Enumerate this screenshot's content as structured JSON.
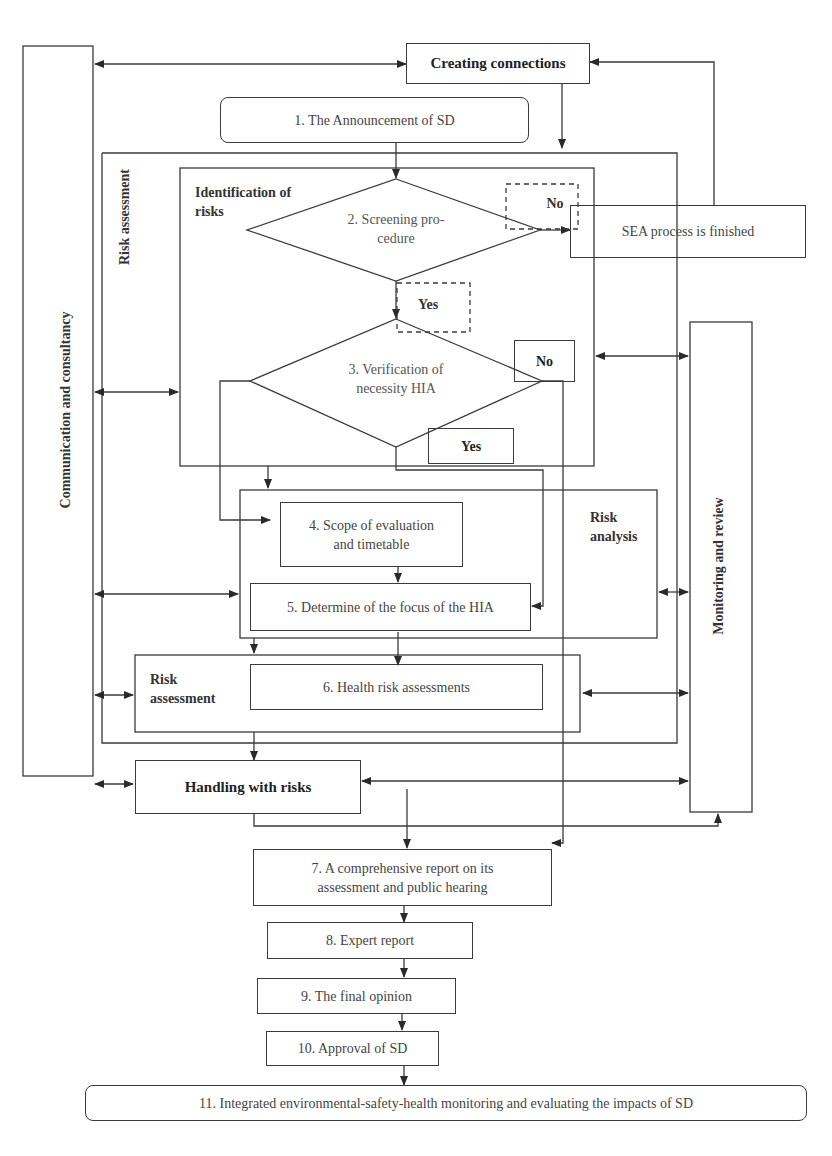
{
  "diagram": {
    "type": "flowchart",
    "side_panels": {
      "left": "Communication and consultancy",
      "right": "Monitoring and review"
    },
    "creating_connections": "Creating connections",
    "frames": {
      "risk_assessment_outer": "Risk assessment",
      "identification_of_risks": "Identification of risks",
      "risk_analysis": "Risk analysis",
      "risk_assessment_inner": "Risk assessment"
    },
    "steps": {
      "s1": "1. The Announcement of SD",
      "s2": "2. Screening procedure",
      "s2_line1": "2. Screening pro-",
      "s2_line2": "cedure",
      "s3_line1": "3. Verification of",
      "s3_line2": "necessity HIA",
      "s4_line1": "4. Scope of evaluation",
      "s4_line2": "and timetable",
      "s5": "5. Determine of the focus of the HIA",
      "s6": "6. Health risk assessments",
      "handling": "Handling with risks",
      "s7_line1": "7. A comprehensive report on its",
      "s7_line2": "assessment  and public hearing",
      "s8": "8. Expert report",
      "s9": "9. The final opinion",
      "s10": "10. Approval of SD",
      "s11": "11. Integrated environmental-safety-health  monitoring and evaluating the impacts of SD"
    },
    "sea_finished": "SEA process is finished",
    "decisions": {
      "screening_no": "No",
      "screening_yes": "Yes",
      "verification_no": "No",
      "verification_yes": "Yes"
    },
    "labels": {
      "identification_line1": "Identification of",
      "identification_line2": "risks",
      "risk_analysis_line1": "Risk",
      "risk_analysis_line2": "analysis",
      "risk_assessment_line1": "Risk",
      "risk_assessment_line2": "assessment"
    }
  }
}
